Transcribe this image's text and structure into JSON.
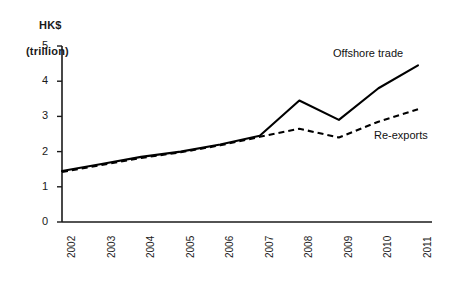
{
  "chart_data": {
    "type": "line",
    "title": "",
    "ylabel": "HK$ (trillion)",
    "ylabel_line1": "HK$",
    "ylabel_line2": "(trillion)",
    "xlabel": "",
    "categories": [
      "2002",
      "2003",
      "2004",
      "2005",
      "2006",
      "2007",
      "2008",
      "2009",
      "2010",
      "2011"
    ],
    "ylim": [
      0,
      5
    ],
    "yticks": [
      "0",
      "1",
      "2",
      "3",
      "4",
      "5"
    ],
    "grid": false,
    "legend_position": "inline-annotation",
    "series": [
      {
        "name": "Offshore trade",
        "style": "solid",
        "color": "#000000",
        "values": [
          1.45,
          1.65,
          1.85,
          2.0,
          2.2,
          2.45,
          3.45,
          2.9,
          3.8,
          4.45
        ]
      },
      {
        "name": "Re-exports",
        "style": "dashed",
        "color": "#000000",
        "values": [
          1.42,
          1.62,
          1.82,
          1.98,
          2.18,
          2.42,
          2.65,
          2.4,
          2.85,
          3.2
        ]
      }
    ]
  },
  "annotations": {
    "offshore_label": "Offshore trade",
    "reexports_label": "Re-exports"
  }
}
